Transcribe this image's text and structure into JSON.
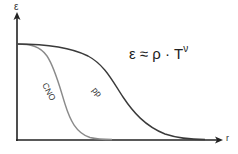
{
  "diagram": {
    "y_axis": {
      "label": "ε"
    },
    "x_axis": {
      "label": "r"
    },
    "formula": {
      "base": "ε ≈ ρ · T",
      "exponent": "ν"
    },
    "curves": [
      {
        "name": "CNO",
        "label": "CNO",
        "color": "#8a8a8a",
        "description": "steep decline near center"
      },
      {
        "name": "pp",
        "label": "pp",
        "color": "#3a3a3a",
        "description": "gradual decline extending farther out"
      }
    ],
    "colors": {
      "axis": "#222222",
      "cno_curve": "#8a8a8a",
      "pp_curve": "#3a3a3a",
      "background": "#ffffff"
    }
  }
}
